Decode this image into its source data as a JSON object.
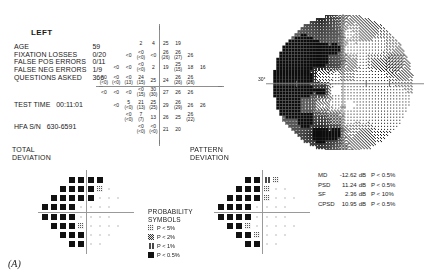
{
  "eye": {
    "label": "LEFT"
  },
  "reliability": {
    "rows": [
      {
        "label": "AGE",
        "value": "59"
      },
      {
        "label": "FIXATION LOSSES",
        "value": "0/20"
      },
      {
        "label": "FALSE POS ERRORS",
        "value": "0/11"
      },
      {
        "label": "FALSE NEG ERRORS",
        "value": "1/9"
      },
      {
        "label": "QUESTIONS ASKED",
        "value": "366"
      }
    ]
  },
  "test_time": {
    "label": "TEST TIME",
    "value": "00:11:01"
  },
  "serial": {
    "label": "HFA S/N",
    "value": "630-6591"
  },
  "sections": {
    "total_deviation": "TOTAL\nDEVIATION",
    "total_deviation_l1": "TOTAL",
    "total_deviation_l2": "DEVIATION",
    "pattern_deviation_l1": "PATTERN",
    "pattern_deviation_l2": "DEVIATION"
  },
  "grayscale": {
    "degree_label": "30°"
  },
  "probability_symbols": {
    "title_l1": "PROBABILITY",
    "title_l2": "SYMBOLS",
    "items": [
      {
        "level": "p5",
        "text": "P <  5%",
        "fill": "#cfcfcf"
      },
      {
        "level": "p2",
        "text": "P <  2%",
        "fill": "#8f8f8f"
      },
      {
        "level": "p1",
        "text": "P <  1%",
        "fill": "#4a4a4a"
      },
      {
        "level": "p05",
        "text": "P < 0.5%",
        "fill": "#111111"
      }
    ]
  },
  "indices": {
    "rows": [
      {
        "key": "MD",
        "value": "-12.62",
        "unit": "dB",
        "p": "P < 0.5%"
      },
      {
        "key": "PSD",
        "value": "11.24",
        "unit": "dB",
        "p": "P < 0.5%"
      },
      {
        "key": "SF",
        "value": "2.36",
        "unit": "dB",
        "p": "P <  10%"
      },
      {
        "key": "CPSD",
        "value": "10.95",
        "unit": "dB",
        "p": "P < 0.5%"
      }
    ]
  },
  "figure_label": "(A)",
  "chart_data": {
    "type": "table",
    "numeric_threshold_plot": {
      "description": "Threshold sensitivity in dB at each test location; values in parentheses are retest values at points with >5 dB difference",
      "units": "dB",
      "points": [
        {
          "x": -9,
          "y": 21,
          "v": "2"
        },
        {
          "x": -3,
          "y": 21,
          "v": "4"
        },
        {
          "x": 3,
          "y": 21,
          "v": "25"
        },
        {
          "x": 9,
          "y": 21,
          "v": "19"
        },
        {
          "x": -15,
          "y": 15,
          "v": "<0"
        },
        {
          "x": -9,
          "y": 15,
          "v": "<0",
          "re": "(<0)"
        },
        {
          "x": -3,
          "y": 15,
          "v": "<0"
        },
        {
          "x": 3,
          "y": 15,
          "v": "26",
          "re": "(26)"
        },
        {
          "x": 9,
          "y": 15,
          "v": "26",
          "re": "(27)"
        },
        {
          "x": 15,
          "y": 15,
          "v": "26"
        },
        {
          "x": -21,
          "y": 9,
          "v": "<0"
        },
        {
          "x": -15,
          "y": 9,
          "v": "<0"
        },
        {
          "x": -9,
          "y": 9,
          "v": "<0",
          "re": "(<0)"
        },
        {
          "x": -3,
          "y": 9,
          "v": "2"
        },
        {
          "x": 3,
          "y": 9,
          "v": "19"
        },
        {
          "x": 9,
          "y": 9,
          "v": "25",
          "re": "(15)"
        },
        {
          "x": 15,
          "y": 9,
          "v": "18"
        },
        {
          "x": 21,
          "y": 9,
          "v": "16"
        },
        {
          "x": -27,
          "y": 3,
          "v": "<0",
          "re": "(<0)"
        },
        {
          "x": -21,
          "y": 3,
          "v": "<0",
          "re": "(<0)"
        },
        {
          "x": -15,
          "y": 3,
          "v": "<0",
          "re": "(13)"
        },
        {
          "x": -9,
          "y": 3,
          "v": "24",
          "re": "(15)"
        },
        {
          "x": -3,
          "y": 3,
          "v": "25"
        },
        {
          "x": 3,
          "y": 3,
          "v": "24"
        },
        {
          "x": 9,
          "y": 3,
          "v": "26",
          "re": "(26)"
        },
        {
          "x": 15,
          "y": 3,
          "v": "26",
          "re": "(26)"
        },
        {
          "x": -27,
          "y": -3,
          "v": "<0"
        },
        {
          "x": -21,
          "y": -3,
          "v": "<0"
        },
        {
          "x": -15,
          "y": -3,
          "v": "<0"
        },
        {
          "x": -9,
          "y": -3,
          "v": "<0",
          "re": "(15)"
        },
        {
          "x": -3,
          "y": -3,
          "v": "30",
          "re": "(30)"
        },
        {
          "x": 3,
          "y": -3,
          "v": "27"
        },
        {
          "x": 9,
          "y": -3,
          "v": "26"
        },
        {
          "x": 15,
          "y": -3,
          "v": "26"
        },
        {
          "x": -21,
          "y": -9,
          "v": "<0"
        },
        {
          "x": -15,
          "y": -9,
          "v": "5",
          "re": "(<0)"
        },
        {
          "x": -9,
          "y": -9,
          "v": "21",
          "re": "(13)"
        },
        {
          "x": -3,
          "y": -9,
          "v": "25",
          "re": "(25)"
        },
        {
          "x": 3,
          "y": -9,
          "v": "29"
        },
        {
          "x": 9,
          "y": -9,
          "v": "26",
          "re": "(29)"
        },
        {
          "x": 15,
          "y": -9,
          "v": "26"
        },
        {
          "x": 21,
          "y": -9,
          "v": "26"
        },
        {
          "x": -15,
          "y": -15,
          "v": "<0",
          "re": "(<0)"
        },
        {
          "x": -9,
          "y": -15,
          "v": "7",
          "re": "(7)"
        },
        {
          "x": -3,
          "y": -15,
          "v": "13"
        },
        {
          "x": 3,
          "y": -15,
          "v": "26"
        },
        {
          "x": 9,
          "y": -15,
          "v": "25"
        },
        {
          "x": 15,
          "y": -15,
          "v": "26",
          "re": "(22)"
        },
        {
          "x": -9,
          "y": -21,
          "v": "<0",
          "re": "(<0)"
        },
        {
          "x": -3,
          "y": -21,
          "v": "<0",
          "re": "(<0)"
        },
        {
          "x": 3,
          "y": -21,
          "v": "21"
        },
        {
          "x": 9,
          "y": -21,
          "v": "20"
        }
      ]
    },
    "total_deviation_plot": {
      "description": "Total deviation probability symbols, left eye",
      "points": [
        {
          "x": -9,
          "y": 21,
          "p": "p05"
        },
        {
          "x": -3,
          "y": 21,
          "p": "p05"
        },
        {
          "x": 3,
          "y": 21,
          "p": "p05"
        },
        {
          "x": 9,
          "y": 21,
          "p": "p05"
        },
        {
          "x": -15,
          "y": 15,
          "p": "p05"
        },
        {
          "x": -9,
          "y": 15,
          "p": "p05"
        },
        {
          "x": -3,
          "y": 15,
          "p": "p05"
        },
        {
          "x": 3,
          "y": 15,
          "p": "p05"
        },
        {
          "x": 9,
          "y": 15,
          "p": "p5"
        },
        {
          "x": 15,
          "y": 15,
          "p": "none"
        },
        {
          "x": -21,
          "y": 9,
          "p": "p05"
        },
        {
          "x": -15,
          "y": 9,
          "p": "p05"
        },
        {
          "x": -9,
          "y": 9,
          "p": "p05"
        },
        {
          "x": -3,
          "y": 9,
          "p": "p05"
        },
        {
          "x": 3,
          "y": 9,
          "p": "p05"
        },
        {
          "x": 9,
          "y": 9,
          "p": "none"
        },
        {
          "x": 15,
          "y": 9,
          "p": "none"
        },
        {
          "x": 21,
          "y": 9,
          "p": "none"
        },
        {
          "x": -27,
          "y": 3,
          "p": "p05"
        },
        {
          "x": -21,
          "y": 3,
          "p": "p05"
        },
        {
          "x": -15,
          "y": 3,
          "p": "p05"
        },
        {
          "x": -9,
          "y": 3,
          "p": "p05"
        },
        {
          "x": -3,
          "y": 3,
          "p": "none"
        },
        {
          "x": 3,
          "y": 3,
          "p": "none"
        },
        {
          "x": 9,
          "y": 3,
          "p": "none"
        },
        {
          "x": 15,
          "y": 3,
          "p": "none"
        },
        {
          "x": -27,
          "y": -3,
          "p": "p05"
        },
        {
          "x": -21,
          "y": -3,
          "p": "p05"
        },
        {
          "x": -15,
          "y": -3,
          "p": "p05"
        },
        {
          "x": -9,
          "y": -3,
          "p": "p05"
        },
        {
          "x": -3,
          "y": -3,
          "p": "none"
        },
        {
          "x": 3,
          "y": -3,
          "p": "none"
        },
        {
          "x": 9,
          "y": -3,
          "p": "none"
        },
        {
          "x": 15,
          "y": -3,
          "p": "none"
        },
        {
          "x": -21,
          "y": -9,
          "p": "p05"
        },
        {
          "x": -15,
          "y": -9,
          "p": "p05"
        },
        {
          "x": -9,
          "y": -9,
          "p": "p05"
        },
        {
          "x": -3,
          "y": -9,
          "p": "p5"
        },
        {
          "x": 3,
          "y": -9,
          "p": "none"
        },
        {
          "x": 9,
          "y": -9,
          "p": "none"
        },
        {
          "x": 15,
          "y": -9,
          "p": "none"
        },
        {
          "x": 21,
          "y": -9,
          "p": "none"
        },
        {
          "x": -15,
          "y": -15,
          "p": "p05"
        },
        {
          "x": -9,
          "y": -15,
          "p": "p05"
        },
        {
          "x": -3,
          "y": -15,
          "p": "p05"
        },
        {
          "x": 3,
          "y": -15,
          "p": "none"
        },
        {
          "x": 9,
          "y": -15,
          "p": "none"
        },
        {
          "x": 15,
          "y": -15,
          "p": "none"
        },
        {
          "x": -9,
          "y": -21,
          "p": "p05"
        },
        {
          "x": -3,
          "y": -21,
          "p": "p05"
        },
        {
          "x": 3,
          "y": -21,
          "p": "none"
        },
        {
          "x": 9,
          "y": -21,
          "p": "none"
        }
      ]
    },
    "pattern_deviation_plot": {
      "description": "Pattern deviation probability symbols, left eye",
      "points": [
        {
          "x": -9,
          "y": 21,
          "p": "p05"
        },
        {
          "x": -3,
          "y": 21,
          "p": "p05"
        },
        {
          "x": 3,
          "y": 21,
          "p": "p1"
        },
        {
          "x": 9,
          "y": 21,
          "p": "p5"
        },
        {
          "x": -15,
          "y": 15,
          "p": "p05"
        },
        {
          "x": -9,
          "y": 15,
          "p": "p05"
        },
        {
          "x": -3,
          "y": 15,
          "p": "p05"
        },
        {
          "x": 3,
          "y": 15,
          "p": "p5"
        },
        {
          "x": 9,
          "y": 15,
          "p": "none"
        },
        {
          "x": 15,
          "y": 15,
          "p": "none"
        },
        {
          "x": -21,
          "y": 9,
          "p": "p05"
        },
        {
          "x": -15,
          "y": 9,
          "p": "p05"
        },
        {
          "x": -9,
          "y": 9,
          "p": "p05"
        },
        {
          "x": -3,
          "y": 9,
          "p": "p05"
        },
        {
          "x": 3,
          "y": 9,
          "p": "p5"
        },
        {
          "x": 9,
          "y": 9,
          "p": "none"
        },
        {
          "x": 15,
          "y": 9,
          "p": "none"
        },
        {
          "x": 21,
          "y": 9,
          "p": "none"
        },
        {
          "x": -27,
          "y": 3,
          "p": "p05"
        },
        {
          "x": -21,
          "y": 3,
          "p": "p05"
        },
        {
          "x": -15,
          "y": 3,
          "p": "p05"
        },
        {
          "x": -9,
          "y": 3,
          "p": "p05"
        },
        {
          "x": -3,
          "y": 3,
          "p": "none"
        },
        {
          "x": 3,
          "y": 3,
          "p": "none"
        },
        {
          "x": 9,
          "y": 3,
          "p": "none"
        },
        {
          "x": 15,
          "y": 3,
          "p": "none"
        },
        {
          "x": -27,
          "y": -3,
          "p": "p05"
        },
        {
          "x": -21,
          "y": -3,
          "p": "p05"
        },
        {
          "x": -15,
          "y": -3,
          "p": "p05"
        },
        {
          "x": -9,
          "y": -3,
          "p": "p05"
        },
        {
          "x": -3,
          "y": -3,
          "p": "none"
        },
        {
          "x": 3,
          "y": -3,
          "p": "none"
        },
        {
          "x": 9,
          "y": -3,
          "p": "none"
        },
        {
          "x": 15,
          "y": -3,
          "p": "none"
        },
        {
          "x": -21,
          "y": -9,
          "p": "p05"
        },
        {
          "x": -15,
          "y": -9,
          "p": "p05"
        },
        {
          "x": -9,
          "y": -9,
          "p": "p5"
        },
        {
          "x": -3,
          "y": -9,
          "p": "none"
        },
        {
          "x": 3,
          "y": -9,
          "p": "none"
        },
        {
          "x": 9,
          "y": -9,
          "p": "none"
        },
        {
          "x": 15,
          "y": -9,
          "p": "none"
        },
        {
          "x": 21,
          "y": -9,
          "p": "none"
        },
        {
          "x": -15,
          "y": -15,
          "p": "p05"
        },
        {
          "x": -9,
          "y": -15,
          "p": "p05"
        },
        {
          "x": -3,
          "y": -15,
          "p": "p5"
        },
        {
          "x": 3,
          "y": -15,
          "p": "none"
        },
        {
          "x": 9,
          "y": -15,
          "p": "none"
        },
        {
          "x": 15,
          "y": -15,
          "p": "none"
        },
        {
          "x": -9,
          "y": -21,
          "p": "p05"
        },
        {
          "x": -3,
          "y": -21,
          "p": "p05"
        },
        {
          "x": 3,
          "y": -21,
          "p": "none"
        },
        {
          "x": 9,
          "y": -21,
          "p": "none"
        }
      ]
    }
  }
}
